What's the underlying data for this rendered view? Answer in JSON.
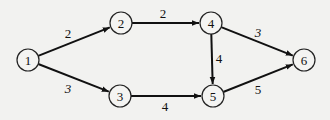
{
  "diagram": {
    "type": "directed-weighted-graph",
    "nodes": [
      {
        "id": "1",
        "label": "1",
        "x": 28,
        "y": 60
      },
      {
        "id": "2",
        "label": "2",
        "x": 121,
        "y": 23
      },
      {
        "id": "3",
        "label": "3",
        "x": 120,
        "y": 96
      },
      {
        "id": "4",
        "label": "4",
        "x": 211,
        "y": 23
      },
      {
        "id": "5",
        "label": "5",
        "x": 213,
        "y": 96
      },
      {
        "id": "6",
        "label": "6",
        "x": 304,
        "y": 60
      }
    ],
    "edges": [
      {
        "from": "1",
        "to": "2",
        "weight": "2",
        "lx": 68,
        "ly": 33,
        "italic": false
      },
      {
        "from": "1",
        "to": "3",
        "weight": "3",
        "lx": 68,
        "ly": 88,
        "italic": true
      },
      {
        "from": "2",
        "to": "4",
        "weight": "2",
        "lx": 163,
        "ly": 13,
        "italic": false
      },
      {
        "from": "3",
        "to": "5",
        "weight": "4",
        "lx": 165,
        "ly": 106,
        "italic": false
      },
      {
        "from": "4",
        "to": "5",
        "weight": "4",
        "lx": 219,
        "ly": 58,
        "italic": false
      },
      {
        "from": "4",
        "to": "6",
        "weight": "3",
        "lx": 258,
        "ly": 32,
        "italic": true
      },
      {
        "from": "5",
        "to": "6",
        "weight": "5",
        "lx": 258,
        "ly": 89,
        "italic": false
      }
    ],
    "node_radius": 11
  }
}
